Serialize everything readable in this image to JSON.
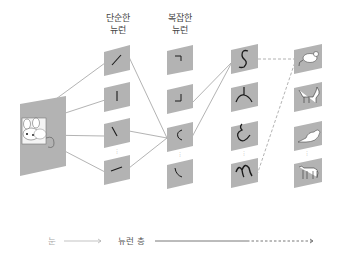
{
  "headers": {
    "simple": [
      "단순한",
      "뉴런"
    ],
    "complex": [
      "복잡한",
      "뉴런"
    ]
  },
  "axis": {
    "eye_label": "눈",
    "layer_label": "뉴런 층"
  },
  "colors": {
    "panel": "#b3b3b3",
    "line": "#9a9a9a",
    "stroke": "#1a1a1a",
    "axis_light": "#aaaaaa",
    "axis_dark": "#555555"
  },
  "diagram": {
    "input": "mouse-image",
    "columns": [
      {
        "name": "simple-neurons",
        "features": [
          "diagonal-slash",
          "vertical-line",
          "backslash",
          "shallow-slash"
        ]
      },
      {
        "name": "complex-neurons",
        "features": [
          "corner-top-right",
          "corner-bottom-right",
          "arc-c",
          "corner-bottom-left"
        ]
      },
      {
        "name": "higher-neurons",
        "features": [
          "s-curve",
          "branch-y",
          "hook-curve",
          "m-wave"
        ]
      },
      {
        "name": "object-neurons",
        "features": [
          "mouse",
          "cat",
          "bird",
          "dog"
        ]
      }
    ]
  }
}
